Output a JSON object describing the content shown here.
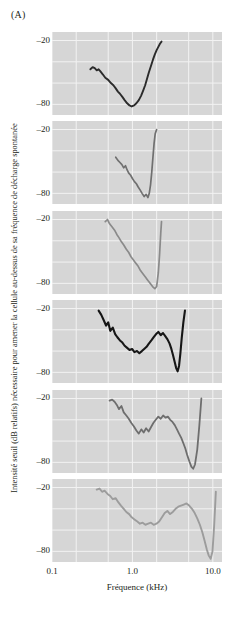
{
  "figure": {
    "panel_label": "(A)",
    "background_color": "#ffffff",
    "plot_background_color": "#d6d6d6",
    "gridline_color": "#f2f2f2"
  },
  "axes": {
    "ylabel": "Intensité seuil (dB relatifs) nécessaire pour amener la cellule au-dessus de sa fréquence de décharge spontanée",
    "xlabel": "Fréquence (kHz)",
    "yticks": [
      "–20",
      "–80"
    ],
    "xticks": [
      "0.1",
      "1.0",
      "10.0"
    ]
  },
  "chart_data": {
    "type": "line",
    "title": "",
    "subtitle": "",
    "xlabel": "Fréquence (kHz)",
    "ylabel": "Intensité seuil (dB relatifs) nécessaire pour amener la cellule au-dessus de sa fréquence de décharge spontanée",
    "xscale": "log",
    "xlim": [
      0.1,
      13.0
    ],
    "ylim": [
      -90,
      -12
    ],
    "ytick_values": [
      -20,
      -80
    ],
    "xtick_values": [
      0.1,
      1.0,
      10.0
    ],
    "grid": true,
    "legend": "none",
    "panel_label": "(A)",
    "n_panels": 6,
    "series": [
      {
        "name": "panel-1",
        "color": "#2b2b2b",
        "linewidth": 1.9,
        "x": [
          0.3,
          0.32,
          0.34,
          0.36,
          0.38,
          0.4,
          0.43,
          0.46,
          0.5,
          0.54,
          0.58,
          0.62,
          0.66,
          0.7,
          0.75,
          0.8,
          0.86,
          0.92,
          0.98,
          1.05,
          1.12,
          1.2,
          1.28,
          1.36,
          1.44,
          1.52,
          1.6,
          1.7,
          1.8,
          1.9,
          2.0,
          2.1,
          2.2,
          2.3
        ],
        "y": [
          -47,
          -45,
          -46,
          -48,
          -47,
          -49,
          -52,
          -55,
          -57,
          -60,
          -62,
          -65,
          -68,
          -70,
          -73,
          -76,
          -79,
          -81,
          -82,
          -81,
          -79,
          -76,
          -72,
          -67,
          -62,
          -56,
          -50,
          -44,
          -38,
          -33,
          -29,
          -26,
          -23,
          -21
        ]
      },
      {
        "name": "panel-2",
        "color": "#707070",
        "linewidth": 1.7,
        "x": [
          0.62,
          0.66,
          0.7,
          0.74,
          0.78,
          0.82,
          0.86,
          0.9,
          0.95,
          1.0,
          1.06,
          1.12,
          1.18,
          1.25,
          1.32,
          1.4,
          1.48,
          1.56,
          1.62,
          1.68,
          1.74,
          1.8,
          1.86,
          1.92,
          2.0
        ],
        "y": [
          -46,
          -49,
          -51,
          -53,
          -56,
          -54,
          -58,
          -61,
          -63,
          -66,
          -69,
          -71,
          -74,
          -77,
          -80,
          -83,
          -81,
          -84,
          -80,
          -72,
          -60,
          -46,
          -33,
          -24,
          -20
        ]
      },
      {
        "name": "panel-3",
        "color": "#8a8a8a",
        "linewidth": 1.7,
        "x": [
          0.46,
          0.49,
          0.52,
          0.56,
          0.6,
          0.64,
          0.68,
          0.73,
          0.78,
          0.84,
          0.9,
          0.96,
          1.03,
          1.1,
          1.18,
          1.26,
          1.35,
          1.45,
          1.55,
          1.66,
          1.78,
          1.9,
          2.0,
          2.1,
          2.18,
          2.25,
          2.3
        ],
        "y": [
          -22,
          -20,
          -24,
          -27,
          -30,
          -34,
          -37,
          -41,
          -44,
          -48,
          -51,
          -55,
          -58,
          -61,
          -64,
          -68,
          -71,
          -74,
          -77,
          -80,
          -83,
          -85,
          -83,
          -70,
          -52,
          -33,
          -22
        ]
      },
      {
        "name": "panel-4",
        "color": "#161616",
        "linewidth": 2.1,
        "x": [
          0.38,
          0.41,
          0.44,
          0.47,
          0.5,
          0.53,
          0.57,
          0.61,
          0.65,
          0.7,
          0.75,
          0.8,
          0.86,
          0.92,
          0.99,
          1.06,
          1.14,
          1.22,
          1.31,
          1.4,
          1.5,
          1.6,
          1.72,
          1.84,
          1.97,
          2.1,
          2.25,
          2.4,
          2.56,
          2.73,
          2.9,
          3.05,
          3.2,
          3.35,
          3.5,
          3.65,
          3.8,
          3.95,
          4.1,
          4.3,
          4.5
        ],
        "y": [
          -22,
          -26,
          -31,
          -36,
          -33,
          -41,
          -38,
          -44,
          -47,
          -50,
          -52,
          -55,
          -57,
          -59,
          -58,
          -61,
          -60,
          -62,
          -60,
          -58,
          -56,
          -53,
          -50,
          -47,
          -44,
          -42,
          -45,
          -43,
          -46,
          -49,
          -53,
          -58,
          -64,
          -70,
          -76,
          -79,
          -74,
          -62,
          -48,
          -33,
          -22
        ]
      },
      {
        "name": "panel-5",
        "color": "#6e6e6e",
        "linewidth": 1.8,
        "x": [
          0.52,
          0.56,
          0.6,
          0.64,
          0.68,
          0.73,
          0.78,
          0.84,
          0.9,
          0.97,
          1.04,
          1.12,
          1.2,
          1.29,
          1.38,
          1.48,
          1.59,
          1.7,
          1.82,
          1.95,
          2.1,
          2.25,
          2.41,
          2.58,
          2.76,
          2.95,
          3.15,
          3.36,
          3.58,
          3.8,
          4.05,
          4.3,
          4.55,
          4.8,
          5.1,
          5.4,
          5.7,
          6.0,
          6.4,
          6.8,
          7.2
        ],
        "y": [
          -22,
          -21,
          -23,
          -26,
          -30,
          -27,
          -33,
          -36,
          -39,
          -43,
          -46,
          -50,
          -53,
          -49,
          -52,
          -48,
          -51,
          -47,
          -43,
          -40,
          -37,
          -39,
          -36,
          -38,
          -37,
          -40,
          -42,
          -45,
          -49,
          -53,
          -57,
          -62,
          -67,
          -73,
          -79,
          -84,
          -86,
          -82,
          -68,
          -45,
          -20
        ]
      },
      {
        "name": "panel-6",
        "color": "#9c9c9c",
        "linewidth": 1.9,
        "x": [
          0.36,
          0.39,
          0.42,
          0.45,
          0.49,
          0.53,
          0.57,
          0.62,
          0.67,
          0.72,
          0.78,
          0.84,
          0.91,
          0.98,
          1.06,
          1.15,
          1.24,
          1.34,
          1.45,
          1.57,
          1.7,
          1.84,
          1.99,
          2.15,
          2.33,
          2.52,
          2.72,
          2.94,
          3.18,
          3.44,
          3.72,
          4.02,
          4.35,
          4.7,
          5.08,
          5.5,
          5.95,
          6.4,
          6.9,
          7.4,
          7.9,
          8.4,
          8.9,
          9.4,
          9.9,
          10.4,
          10.9
        ],
        "y": [
          -22,
          -21,
          -24,
          -23,
          -26,
          -28,
          -31,
          -30,
          -34,
          -37,
          -40,
          -43,
          -45,
          -48,
          -50,
          -52,
          -54,
          -53,
          -55,
          -54,
          -53,
          -55,
          -54,
          -52,
          -48,
          -44,
          -42,
          -45,
          -43,
          -40,
          -38,
          -37,
          -36,
          -35,
          -37,
          -40,
          -44,
          -49,
          -55,
          -62,
          -70,
          -78,
          -84,
          -87,
          -80,
          -55,
          -24
        ]
      }
    ]
  }
}
